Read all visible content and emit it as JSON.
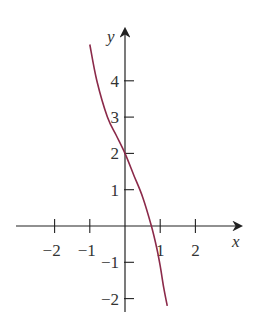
{
  "chart_data": {
    "type": "line",
    "title": "",
    "xlabel": "x",
    "ylabel": "y",
    "xlim": [
      -3,
      3
    ],
    "ylim": [
      -2.3,
      5.2
    ],
    "x_ticks": [
      -2,
      -1,
      1,
      2
    ],
    "x_tick_labels": [
      "−2",
      "−1",
      "1",
      "2"
    ],
    "y_ticks": [
      -2,
      -1,
      1,
      2,
      3,
      4
    ],
    "y_tick_labels": [
      "−2",
      "−1",
      "1",
      "2",
      "3",
      "4"
    ],
    "grid": false,
    "legend": null,
    "series": [
      {
        "name": "curve",
        "color": "#8b2a4a",
        "x": [
          -1.0,
          -0.8,
          -0.5,
          -0.25,
          0.0,
          0.25,
          0.5,
          0.75,
          0.9,
          1.0,
          1.1,
          1.2
        ],
        "y": [
          5.0,
          4.0,
          3.0,
          2.5,
          2.0,
          1.4,
          0.8,
          0.0,
          -0.6,
          -1.1,
          -1.7,
          -2.2
        ]
      }
    ]
  }
}
